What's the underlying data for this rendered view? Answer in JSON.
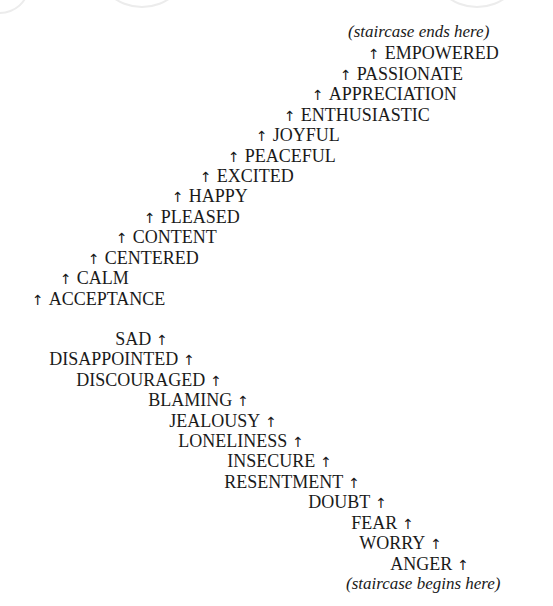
{
  "diagram": {
    "top_note": "(staircase ends here)",
    "bottom_note": "(staircase begins here)",
    "arrow_glyph": "↑",
    "upper_steps": [
      {
        "label": "EMPOWERED",
        "x": 368,
        "y": 43
      },
      {
        "label": "PASSIONATE",
        "x": 340,
        "y": 64
      },
      {
        "label": "APPRECIATION",
        "x": 312,
        "y": 84
      },
      {
        "label": "ENTHUSIASTIC",
        "x": 284,
        "y": 105
      },
      {
        "label": "JOYFUL",
        "x": 256,
        "y": 125
      },
      {
        "label": "PEACEFUL",
        "x": 228,
        "y": 146
      },
      {
        "label": "EXCITED",
        "x": 200,
        "y": 166
      },
      {
        "label": "HAPPY",
        "x": 172,
        "y": 186
      },
      {
        "label": "PLEASED",
        "x": 144,
        "y": 207
      },
      {
        "label": "CONTENT",
        "x": 116,
        "y": 227
      },
      {
        "label": "CENTERED",
        "x": 88,
        "y": 248
      },
      {
        "label": "CALM",
        "x": 60,
        "y": 268
      },
      {
        "label": "ACCEPTANCE",
        "x": 32,
        "y": 289
      }
    ],
    "lower_steps": [
      {
        "label": "SAD",
        "right": 385,
        "y": 329
      },
      {
        "label": "DISAPPOINTED",
        "right": 358,
        "y": 349
      },
      {
        "label": "DISCOURAGED",
        "right": 331,
        "y": 370
      },
      {
        "label": "BLAMING",
        "right": 304,
        "y": 390
      },
      {
        "label": "JEALOUSY",
        "right": 276,
        "y": 411
      },
      {
        "label": "LONELINESS",
        "right": 249,
        "y": 431
      },
      {
        "label": "INSECURE",
        "right": 221,
        "y": 451
      },
      {
        "label": "RESENTMENT",
        "right": 193,
        "y": 472
      },
      {
        "label": "DOUBT",
        "right": 166,
        "y": 492
      },
      {
        "label": "FEAR",
        "right": 139,
        "y": 513
      },
      {
        "label": "WORRY",
        "right": 111,
        "y": 533
      },
      {
        "label": "ANGER",
        "right": 84,
        "y": 554
      }
    ]
  }
}
